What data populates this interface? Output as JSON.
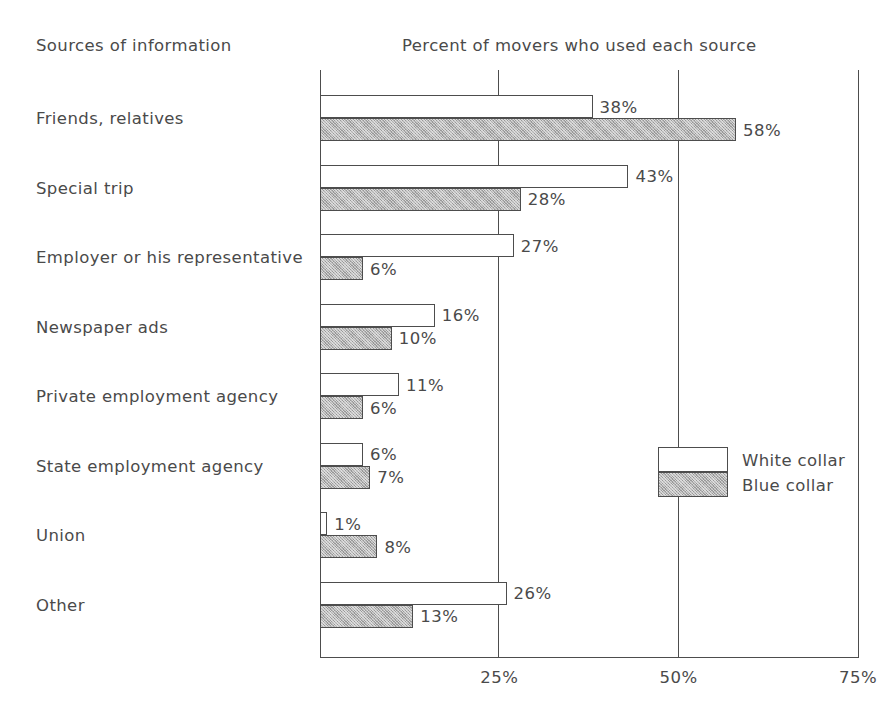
{
  "header": {
    "left_title": "Sources of information",
    "right_title": "Percent of movers who used each source"
  },
  "legend": {
    "white_label": "White collar",
    "blue_label": "Blue collar"
  },
  "axis": {
    "ticks": [
      {
        "label": "25%",
        "value": 25
      },
      {
        "label": "50%",
        "value": 50
      },
      {
        "label": "75%",
        "value": 75
      }
    ]
  },
  "chart_data": {
    "type": "bar",
    "orientation": "horizontal",
    "title": "Percent of movers who used each source",
    "xlabel": "Percent of movers who used each source",
    "ylabel": "Sources of information",
    "xlim": [
      0,
      75
    ],
    "grid": true,
    "legend_position": "center-right",
    "categories": [
      "Friends, relatives",
      "Special trip",
      "Employer or his representative",
      "Newspaper ads",
      "Private employment agency",
      "State employment agency",
      "Union",
      "Other"
    ],
    "series": [
      {
        "name": "White collar",
        "color": "#ffffff",
        "values": [
          38,
          43,
          27,
          16,
          11,
          6,
          1,
          26
        ],
        "value_labels": [
          "38%",
          "43%",
          "27%",
          "16%",
          "11%",
          "6%",
          "1%",
          "26%"
        ]
      },
      {
        "name": "Blue collar",
        "color": "#b3b3b3",
        "values": [
          58,
          28,
          6,
          10,
          6,
          7,
          8,
          13
        ],
        "value_labels": [
          "58%",
          "28%",
          "6%",
          "10%",
          "6%",
          "7%",
          "8%",
          "13%"
        ]
      }
    ]
  }
}
